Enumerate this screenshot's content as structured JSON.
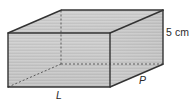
{
  "figure": {
    "kind": "rectangular-prism-diagram",
    "shape_name": "rectangular prism",
    "fill_color": "#c9c9c9",
    "top_fill_color": "#cccccc",
    "side_fill_color": "#c6c6c6",
    "edge_color": "#333333",
    "hidden_edge_color": "#555555",
    "background_color": "#ffffff",
    "labels": {
      "height": "5 cm",
      "depth": "P",
      "length": "L"
    },
    "geometry": {
      "front_face": [
        [
          8,
          33
        ],
        [
          110,
          33
        ],
        [
          110,
          87
        ],
        [
          8,
          87
        ]
      ],
      "back_offset": [
        53,
        -23
      ],
      "back_face": [
        [
          61,
          10
        ],
        [
          163,
          10
        ],
        [
          163,
          64
        ],
        [
          61,
          64
        ]
      ],
      "hidden_vertex": [
        61,
        64
      ],
      "visible_faces": [
        "front",
        "top",
        "right"
      ],
      "hidden_edges": [
        "back-left-vertical",
        "back-bottom-horizontal",
        "back-bottom-diagonal"
      ]
    }
  }
}
